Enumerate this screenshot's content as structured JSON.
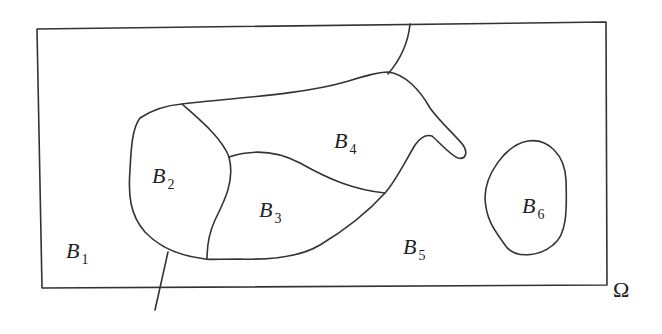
{
  "diagram": {
    "domain_label": "Ω",
    "regions": [
      {
        "id": "B1",
        "letter": "B",
        "subscript": "1"
      },
      {
        "id": "B2",
        "letter": "B",
        "subscript": "2"
      },
      {
        "id": "B3",
        "letter": "B",
        "subscript": "3"
      },
      {
        "id": "B4",
        "letter": "B",
        "subscript": "4"
      },
      {
        "id": "B5",
        "letter": "B",
        "subscript": "5"
      },
      {
        "id": "B6",
        "letter": "B",
        "subscript": "6"
      }
    ],
    "stroke_color": "#333333",
    "background": "#ffffff"
  }
}
